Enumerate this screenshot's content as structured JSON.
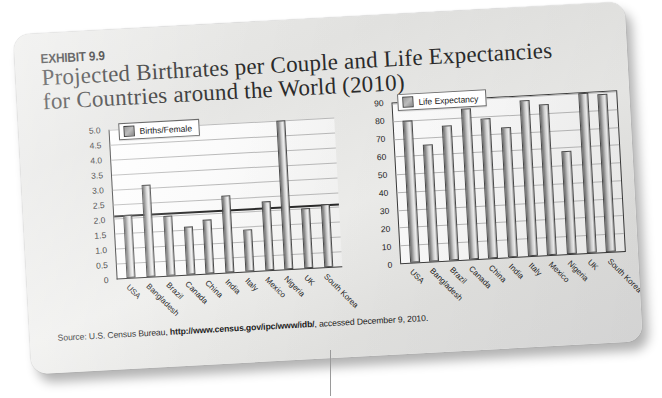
{
  "exhibit": {
    "number_label": "EXHIBIT 9.9",
    "title_line1": "Projected Birthrates per Couple and Life Expectancies",
    "title_line2": "for Countries around the World (2010)"
  },
  "source_note": {
    "prefix": "Source: U.S. Census Bureau, ",
    "url": "http://www.census.gov/ipc/www/idb/",
    "suffix": ", accessed December 9, 2010."
  },
  "chart_data": [
    {
      "type": "bar",
      "id": "births-per-female",
      "title": "Births/Female",
      "legend": [
        "Births/Female"
      ],
      "legend_position": "top-left-inside",
      "xlabel": "",
      "ylabel": "",
      "ylim": [
        0,
        5.0
      ],
      "yticks": [
        "0",
        "0.5",
        "1.0",
        "1.5",
        "2.0",
        "2.5",
        "3.0",
        "3.5",
        "4.0",
        "4.5",
        "5.0"
      ],
      "grid": true,
      "reference_line": 2.1,
      "categories": [
        "USA",
        "Bangladesh",
        "Brazil",
        "Canada",
        "China",
        "India",
        "Italy",
        "Mexico",
        "Nigeria",
        "UK",
        "South Korea"
      ],
      "values": [
        2.1,
        3.1,
        2.0,
        1.6,
        1.8,
        2.6,
        1.4,
        2.3,
        5.0,
        2.0,
        2.1
      ]
    },
    {
      "type": "bar",
      "id": "life-expectancy",
      "title": "Life Expectancy",
      "legend": [
        "Life Expectancy"
      ],
      "legend_position": "top-left-inside",
      "xlabel": "",
      "ylabel": "",
      "ylim": [
        0,
        90
      ],
      "yticks": [
        "0",
        "10",
        "20",
        "30",
        "40",
        "50",
        "60",
        "70",
        "80",
        "90"
      ],
      "grid": true,
      "categories": [
        "USA",
        "Bangladesh",
        "Brazil",
        "Canada",
        "China",
        "India",
        "Italy",
        "Mexico",
        "Nigeria",
        "UK",
        "South Korea"
      ],
      "values": [
        80,
        66,
        76,
        85,
        79,
        73,
        88,
        85,
        58,
        90,
        89
      ]
    }
  ],
  "colors": {
    "card_background": "#e7e7e5",
    "bar_fill": "#c8c8c8",
    "bar_outline": "#4a4a4a",
    "axis": "#3a3a3a",
    "gridline": "#b9b9b9",
    "reference_line": "#2a2a2a",
    "text": "#1c1c1c"
  }
}
